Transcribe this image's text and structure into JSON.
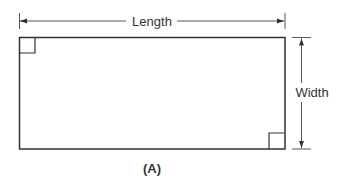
{
  "diagram": {
    "type": "rectangle-dimensions",
    "labels": {
      "length": "Length",
      "width": "Width",
      "caption": "(A)"
    },
    "colors": {
      "stroke": "#333333",
      "dimension_line": "#555555",
      "background": "#ffffff"
    },
    "shape": {
      "name": "rectangle",
      "right_angle_markers": [
        "top-left",
        "bottom-right"
      ]
    }
  }
}
